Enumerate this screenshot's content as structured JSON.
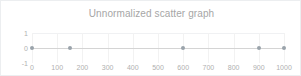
{
  "chart_data": {
    "type": "scatter",
    "title": "Unnormalized scatter graph",
    "xlabel": "",
    "ylabel": "",
    "xlim": [
      0,
      1000
    ],
    "ylim": [
      -1,
      1
    ],
    "grid": true,
    "legend": "none",
    "xticks": [
      "0",
      "100",
      "200",
      "300",
      "400",
      "500",
      "600",
      "700",
      "800",
      "900",
      "1000"
    ],
    "xtick_values": [
      0,
      100,
      200,
      300,
      400,
      500,
      600,
      700,
      800,
      900,
      1000
    ],
    "yticks": [
      "1",
      "0",
      "-1"
    ],
    "ytick_values": [
      1,
      0,
      -1
    ],
    "series": [
      {
        "name": "points",
        "marker_color": "#9aa3ab",
        "x": [
          0,
          150,
          600,
          900,
          1000
        ],
        "y": [
          0,
          0,
          0,
          0,
          0
        ]
      }
    ]
  },
  "colors": {
    "title": "#a6a6a6",
    "tick_label": "#b0b0b0",
    "gridline": "#f2f2f2",
    "axis_line": "#d4d4d4",
    "marker": "#9aa3ab",
    "card_border": "#eceef0",
    "background": "#ffffff"
  }
}
